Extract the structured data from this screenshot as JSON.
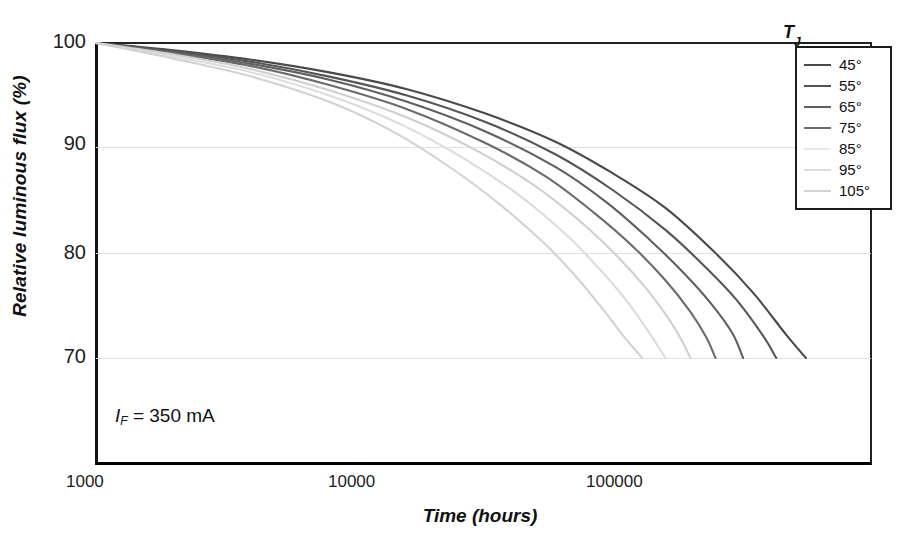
{
  "chart_data": {
    "type": "line",
    "title": "",
    "xlabel": "Time (hours)",
    "ylabel": "Relative luminous flux (%)",
    "xscale": "log",
    "xlim": [
      1000,
      1000000
    ],
    "ylim": [
      70,
      100
    ],
    "xticks": [
      1000,
      10000,
      100000
    ],
    "xtick_labels": [
      "1000",
      "10000",
      "100000"
    ],
    "yticks": [
      70,
      80,
      90,
      100
    ],
    "ytick_labels": [
      "70",
      "90",
      "80",
      "100"
    ],
    "grid": "horizontal",
    "legend_position": "top-right",
    "legend_title": "TJ",
    "annotation": "IF = 350 mA",
    "series": [
      {
        "name": "45°",
        "color": "#4a4a4a",
        "x": [
          1000,
          2000,
          4000,
          8000,
          16000,
          32000,
          60000,
          100000,
          160000,
          250000,
          350000,
          470000,
          560000
        ],
        "y": [
          100,
          99.3,
          98.4,
          97.2,
          95.6,
          93.3,
          90.6,
          87.6,
          84.3,
          80.0,
          76.2,
          72.2,
          70.0
        ]
      },
      {
        "name": "55°",
        "color": "#555555",
        "x": [
          1000,
          2000,
          4000,
          8000,
          16000,
          32000,
          60000,
          100000,
          160000,
          230000,
          300000,
          380000,
          430000
        ],
        "y": [
          100,
          99.2,
          98.2,
          96.8,
          95.0,
          92.5,
          89.4,
          86.0,
          82.2,
          78.6,
          75.6,
          72.2,
          70.0
        ]
      },
      {
        "name": "65°",
        "color": "#5f5f5f",
        "x": [
          1000,
          2000,
          4000,
          8000,
          16000,
          32000,
          60000,
          95000,
          140000,
          190000,
          240000,
          290000,
          320000
        ],
        "y": [
          100,
          99.1,
          98.0,
          96.5,
          94.4,
          91.6,
          88.2,
          84.8,
          81.2,
          78.0,
          75.2,
          72.4,
          70.0
        ]
      },
      {
        "name": "75°",
        "color": "#6b6b6b",
        "x": [
          1000,
          2000,
          4000,
          8000,
          16000,
          32000,
          55000,
          85000,
          120000,
          160000,
          200000,
          230000,
          250000
        ],
        "y": [
          100,
          99.0,
          97.8,
          96.0,
          93.7,
          90.5,
          87.3,
          83.8,
          80.6,
          77.4,
          74.4,
          72.0,
          70.0
        ]
      },
      {
        "name": "85°",
        "color": "#cfcfcf",
        "x": [
          1000,
          2000,
          4000,
          8000,
          16000,
          30000,
          50000,
          75000,
          105000,
          135000,
          165000,
          185000,
          200000
        ],
        "y": [
          100,
          98.9,
          97.5,
          95.5,
          92.9,
          89.7,
          86.4,
          83.0,
          79.6,
          76.6,
          73.7,
          71.7,
          70.0
        ]
      },
      {
        "name": "95°",
        "color": "#dcdcdc",
        "x": [
          1000,
          2000,
          4000,
          8000,
          15000,
          27000,
          44000,
          65000,
          88000,
          112000,
          135000,
          150000,
          160000
        ],
        "y": [
          100,
          98.7,
          97.2,
          95.0,
          92.3,
          88.9,
          85.4,
          81.9,
          78.6,
          75.6,
          72.8,
          71.1,
          70.0
        ]
      },
      {
        "name": "105°",
        "color": "#d2d2d2",
        "x": [
          1000,
          2000,
          4000,
          8000,
          14000,
          24000,
          38000,
          55000,
          73000,
          92000,
          110000,
          122000,
          130000
        ],
        "y": [
          100,
          98.5,
          96.8,
          94.4,
          91.6,
          88.0,
          84.3,
          80.8,
          77.6,
          74.6,
          72.1,
          70.8,
          70.0
        ]
      }
    ]
  },
  "axes": {
    "y_title": "Relative luminous flux (%)",
    "x_title": "Time (hours)",
    "y_labels": [
      "100",
      "90",
      "80",
      "70"
    ],
    "x_labels": [
      "1000",
      "10000",
      "100000"
    ]
  },
  "annotation": {
    "symbol": "I",
    "subscript": "F",
    "value": " = 350 mA"
  },
  "legend": {
    "title_main": "T",
    "title_sub": "J",
    "items": [
      {
        "label": "45°",
        "color": "#4a4a4a"
      },
      {
        "label": "55°",
        "color": "#555555"
      },
      {
        "label": "65°",
        "color": "#5f5f5f"
      },
      {
        "label": "75°",
        "color": "#6b6b6b"
      },
      {
        "label": "85°",
        "color": "#e8e8e8"
      },
      {
        "label": "95°",
        "color": "#dcdcdc"
      },
      {
        "label": "105°",
        "color": "#d2d2d2"
      }
    ]
  }
}
